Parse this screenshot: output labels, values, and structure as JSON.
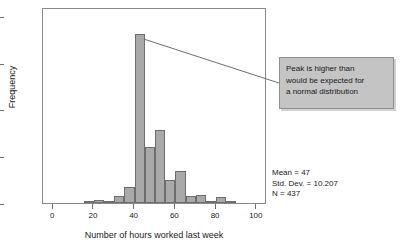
{
  "chart_data": {
    "type": "bar",
    "title": "",
    "subtitle": "",
    "xlabel": "Number of hours worked last week",
    "ylabel": "Frequency",
    "xlim": [
      -5,
      105
    ],
    "ylim": [
      0,
      210
    ],
    "xticks": [
      0,
      20,
      40,
      60,
      80,
      100
    ],
    "xticklabels": [
      "0",
      "20",
      "40",
      "60",
      "80",
      "100"
    ],
    "yticks": [
      0,
      50,
      100,
      150,
      200
    ],
    "yticklabels": [
      "0",
      "50",
      "100",
      "150",
      "200"
    ],
    "grid": false,
    "legend": null,
    "bin_width": 5,
    "bins": [
      {
        "x0": 15,
        "x1": 20,
        "center": 17.5,
        "value": 1
      },
      {
        "x0": 20,
        "x1": 25,
        "center": 22.5,
        "value": 3
      },
      {
        "x0": 25,
        "x1": 30,
        "center": 27.5,
        "value": 1
      },
      {
        "x0": 30,
        "x1": 35,
        "center": 32.5,
        "value": 7
      },
      {
        "x0": 35,
        "x1": 40,
        "center": 37.5,
        "value": 17
      },
      {
        "x0": 40,
        "x1": 45,
        "center": 42.5,
        "value": 181
      },
      {
        "x0": 45,
        "x1": 50,
        "center": 47.5,
        "value": 60
      },
      {
        "x0": 50,
        "x1": 55,
        "center": 52.5,
        "value": 78
      },
      {
        "x0": 55,
        "x1": 60,
        "center": 57.5,
        "value": 25
      },
      {
        "x0": 60,
        "x1": 65,
        "center": 62.5,
        "value": 34
      },
      {
        "x0": 65,
        "x1": 70,
        "center": 67.5,
        "value": 7
      },
      {
        "x0": 70,
        "x1": 75,
        "center": 72.5,
        "value": 9
      },
      {
        "x0": 75,
        "x1": 80,
        "center": 77.5,
        "value": 1
      },
      {
        "x0": 80,
        "x1": 85,
        "center": 82.5,
        "value": 6
      },
      {
        "x0": 85,
        "x1": 90,
        "center": 87.5,
        "value": 2
      }
    ],
    "categories": [
      "17.5",
      "22.5",
      "27.5",
      "32.5",
      "37.5",
      "42.5",
      "47.5",
      "52.5",
      "57.5",
      "62.5",
      "67.5",
      "72.5",
      "77.5",
      "82.5",
      "87.5"
    ],
    "values": [
      1,
      3,
      1,
      7,
      17,
      181,
      60,
      78,
      25,
      34,
      7,
      9,
      1,
      6,
      2
    ],
    "bar_fill_color": "#a9a9a9",
    "bar_border_color": "#6e6e6e",
    "annotations": [
      {
        "name": "peak-callout",
        "text": "Peak is higher than\nwould be expected for\na normal distribution",
        "points_to_bin_center": 42.5,
        "background_color": "#c4c4c4",
        "border_color": "#8e8e8e"
      }
    ],
    "stats": {
      "mean_label": "Mean = 47",
      "std_dev_label": "Std. Dev. = 10.207",
      "n_label": "N = 437",
      "mean": 47,
      "std_dev": 10.207,
      "n": 437
    }
  }
}
